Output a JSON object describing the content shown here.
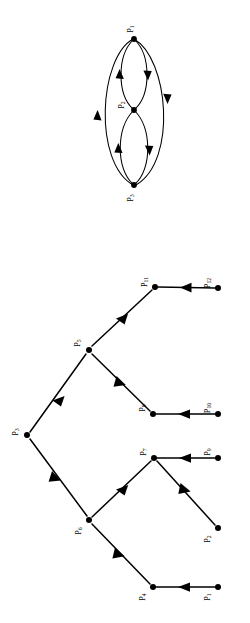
{
  "figure": {
    "orientation_degrees": 90,
    "background_color": "#ffffff",
    "ink_color": "#000000",
    "panels": [
      {
        "id": "panel-top",
        "name": "cyclic-multigraph",
        "description": "Three vertices in a chain with opposite-direction arc pairs and two long outer arcs",
        "nodes": [
          {
            "id": "P1",
            "label": "P",
            "sub": "1",
            "x": 134,
            "y": 39
          },
          {
            "id": "P2",
            "label": "P",
            "sub": "2",
            "x": 134,
            "y": 110
          },
          {
            "id": "P3",
            "label": "P",
            "sub": "3",
            "x": 134,
            "y": 185
          }
        ],
        "edges": [
          {
            "from": "P1",
            "to": "P2",
            "style": "arc-right"
          },
          {
            "from": "P2",
            "to": "P1",
            "style": "arc-left"
          },
          {
            "from": "P2",
            "to": "P3",
            "style": "arc-right"
          },
          {
            "from": "P3",
            "to": "P2",
            "style": "arc-left"
          },
          {
            "from": "P1",
            "to": "P3",
            "style": "outer-arc-right"
          },
          {
            "from": "P3",
            "to": "P1",
            "style": "outer-arc-left"
          }
        ]
      },
      {
        "id": "panel-bottom",
        "name": "rooted-in-tree",
        "description": "Rooted in-tree with all arrows pointing toward the root P3",
        "nodes": [
          {
            "id": "P3",
            "label": "P",
            "sub": "3",
            "x": 27,
            "y": 435
          },
          {
            "id": "P5",
            "label": "P",
            "sub": "5",
            "x": 89,
            "y": 350
          },
          {
            "id": "P6",
            "label": "P",
            "sub": "6",
            "x": 89,
            "y": 520
          },
          {
            "id": "P11",
            "label": "P",
            "sub": "11",
            "x": 155,
            "y": 287
          },
          {
            "id": "P8",
            "label": "P",
            "sub": "8",
            "x": 153,
            "y": 414
          },
          {
            "id": "P7",
            "label": "P",
            "sub": "7",
            "x": 154,
            "y": 458
          },
          {
            "id": "P4",
            "label": "P",
            "sub": "4",
            "x": 153,
            "y": 587
          },
          {
            "id": "P12",
            "label": "P",
            "sub": "12",
            "x": 218,
            "y": 288
          },
          {
            "id": "P10",
            "label": "P",
            "sub": "10",
            "x": 218,
            "y": 414
          },
          {
            "id": "P9",
            "label": "P",
            "sub": "9",
            "x": 218,
            "y": 458
          },
          {
            "id": "P2",
            "label": "P",
            "sub": "2",
            "x": 218,
            "y": 528
          },
          {
            "id": "P1",
            "label": "P",
            "sub": "1",
            "x": 218,
            "y": 587
          }
        ],
        "edges": [
          {
            "from": "P5",
            "to": "P3",
            "style": "straight"
          },
          {
            "from": "P6",
            "to": "P3",
            "style": "straight"
          },
          {
            "from": "P11",
            "to": "P5",
            "style": "straight"
          },
          {
            "from": "P8",
            "to": "P5",
            "style": "straight"
          },
          {
            "from": "P7",
            "to": "P6",
            "style": "straight"
          },
          {
            "from": "P4",
            "to": "P6",
            "style": "straight"
          },
          {
            "from": "P12",
            "to": "P11",
            "style": "straight"
          },
          {
            "from": "P10",
            "to": "P8",
            "style": "straight"
          },
          {
            "from": "P9",
            "to": "P7",
            "style": "straight"
          },
          {
            "from": "P2",
            "to": "P7",
            "style": "straight"
          },
          {
            "from": "P1",
            "to": "P4",
            "style": "straight"
          }
        ]
      }
    ]
  }
}
